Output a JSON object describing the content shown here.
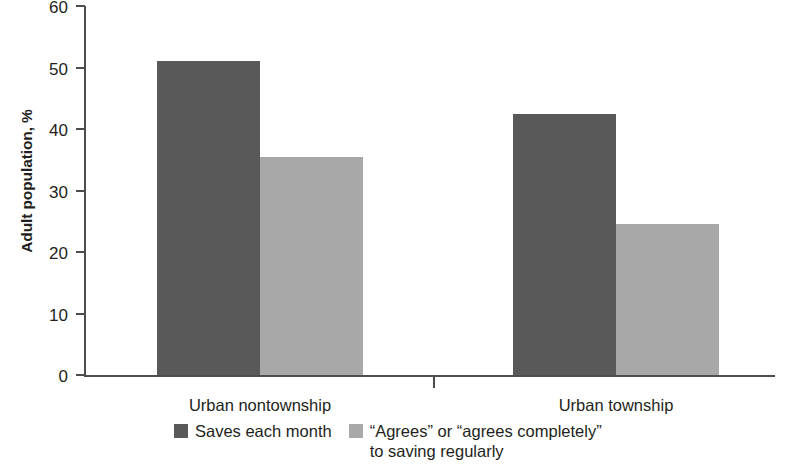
{
  "chart_data": {
    "type": "bar",
    "title": "",
    "xlabel": "",
    "ylabel": "Adult population, %",
    "ylim": [
      0,
      60
    ],
    "ytick_values": [
      60,
      50,
      40,
      30,
      20,
      10,
      0
    ],
    "ytick_labels": [
      "60",
      "50",
      "40",
      "30",
      "20",
      "10",
      "0"
    ],
    "grid": false,
    "legend_position": "bottom",
    "categories": [
      "Urban nontownship",
      "Urban township"
    ],
    "series": [
      {
        "name": "Saves each month",
        "color": "#595959",
        "values": [
          51.0,
          42.5
        ]
      },
      {
        "name": "“Agrees” or “agrees completely”\nto saving regularly",
        "color": "#a8a8a8",
        "values": [
          35.5,
          24.5
        ]
      }
    ]
  },
  "axes": {
    "y_title": "Adult population, %"
  },
  "legend": {
    "items": [
      {
        "label": "Saves each month",
        "color": "#595959"
      },
      {
        "label": "“Agrees” or “agrees completely”\nto saving regularly",
        "color": "#a8a8a8"
      }
    ]
  }
}
